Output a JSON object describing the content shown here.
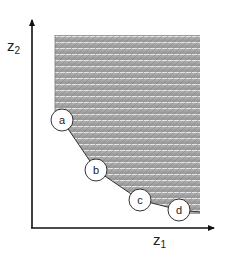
{
  "diagram": {
    "type": "pareto-front-feasible-region",
    "axes": {
      "x": {
        "label": "z",
        "subscript": "1"
      },
      "y": {
        "label": "z",
        "subscript": "2"
      }
    },
    "points": [
      {
        "id": "a",
        "label": "a",
        "cx": 62,
        "cy": 120
      },
      {
        "id": "b",
        "label": "b",
        "cx": 96,
        "cy": 170
      },
      {
        "id": "c",
        "label": "c",
        "cx": 140,
        "cy": 200
      },
      {
        "id": "d",
        "label": "d",
        "cx": 179,
        "cy": 210
      }
    ],
    "region": {
      "fill": "#9a9a9a",
      "stripe_light": "#e4e4e4",
      "description": "shaded striped feasible region bounded below-left by piecewise-linear front through a, b, c, d"
    },
    "colors": {
      "axis": "#111111",
      "outline": "#333333",
      "circle_fill": "#ffffff"
    }
  }
}
